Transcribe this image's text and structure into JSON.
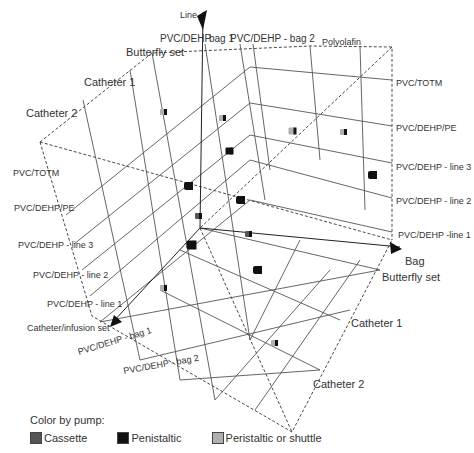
{
  "chart_data": {
    "type": "scatter",
    "subtype": "3d-scatter",
    "title": "",
    "axes": {
      "line": {
        "label": "Line",
        "ticks": [
          "PVC/DEHP - line 1",
          "PVC/DEHP - line 2",
          "PVC/DEHP - line 3",
          "PVC/DEHP/PE",
          "PVC/TOTM"
        ],
        "ticks_right_side": [
          "PVC/DEHP -line 1",
          "PVC/DEHP - line 2",
          "PVC/DEHP - line 3",
          "PVC/DEHP/PE",
          "PVC/TOTM"
        ]
      },
      "bag": {
        "label": "Bag",
        "ticks": [
          "PVC/DEHP - bag 1",
          "PVC/DEHP - bag 2",
          "Polyolafin"
        ]
      },
      "catheter_infusion_set": {
        "label": "Catheter/infusion set",
        "ticks": [
          "Butterfly set",
          "Catheter 1",
          "Catheter 2"
        ]
      }
    },
    "legend": {
      "title": "Color by pump:",
      "entries": [
        {
          "name": "Cassette",
          "color": "#555555"
        },
        {
          "name": "Penistaltic",
          "color": "#111111"
        },
        {
          "name": "Peristaltic or shuttle",
          "color": "#b0b0b0"
        }
      ]
    },
    "points": [
      {
        "x": 163,
        "y": 112,
        "pump": "Peristaltic or shuttle",
        "size": 6
      },
      {
        "x": 222,
        "y": 118,
        "pump": "Peristaltic or shuttle",
        "size": 6
      },
      {
        "x": 292,
        "y": 131,
        "pump": "Peristaltic or shuttle",
        "size": 7
      },
      {
        "x": 343,
        "y": 132,
        "pump": "Peristaltic or shuttle",
        "size": 6
      },
      {
        "x": 229,
        "y": 151,
        "pump": "Penistaltic",
        "size": 7
      },
      {
        "x": 372,
        "y": 175,
        "pump": "Penistaltic",
        "size": 8
      },
      {
        "x": 188,
        "y": 186,
        "pump": "Penistaltic",
        "size": 8
      },
      {
        "x": 240,
        "y": 200,
        "pump": "Penistaltic",
        "size": 8
      },
      {
        "x": 198,
        "y": 216,
        "pump": "Cassette",
        "size": 6
      },
      {
        "x": 248,
        "y": 234,
        "pump": "Cassette",
        "size": 6
      },
      {
        "x": 191,
        "y": 245,
        "pump": "Penistaltic",
        "size": 9
      },
      {
        "x": 257,
        "y": 270,
        "pump": "Penistaltic",
        "size": 8
      },
      {
        "x": 163,
        "y": 288,
        "pump": "Peristaltic or shuttle",
        "size": 6
      },
      {
        "x": 274,
        "y": 343,
        "pump": "Peristaltic or shuttle",
        "size": 6
      }
    ],
    "grid": true
  },
  "labels": {
    "line_axis": "Line",
    "bag_axis": "Bag",
    "cat_axis": "Catheter/infusion set",
    "top_bag1": "PVC/DEHP - bag 1",
    "top_bag1_short": "PVC/DEHP",
    "top_bag1_tail": "bag 1",
    "top_bag2": "PVC/DEHP - bag 2",
    "top_poly": "Polyolafin",
    "left_butterfly": "Butterfly set",
    "left_cath1": "Catheter 1",
    "left_cath2": "Catheter 2",
    "left_totm": "PVC/TOTM",
    "left_pe": "PVC/DEHP/PE",
    "left_line3": "PVC/DEHP - line 3",
    "left_line2": "PVC/DEHP - line 2",
    "left_line1": "PVC/DEHP - line 1",
    "right_totm": "PVC/TOTM",
    "right_pe": "PVC/DEHP/PE",
    "right_line3": "PVC/DEHP - line 3",
    "right_line2": "PVC/DEHP - line 2",
    "right_line1": "PVC/DEHP -line 1",
    "right_butterfly": "Butterfly set",
    "right_cath1": "Catheter 1",
    "right_cath2": "Catheter 2",
    "bottom_bag1": "PVC/DEHP - bag 1",
    "bottom_bag2": "PVC/DEHP - bag 2"
  },
  "legend": {
    "title": "Color by pump:",
    "items": [
      {
        "label": "Cassette",
        "color": "#555555"
      },
      {
        "label": "Penistaltic",
        "color": "#111111"
      },
      {
        "label": "Peristaltic or shuttle",
        "color": "#b0b0b0"
      }
    ]
  }
}
